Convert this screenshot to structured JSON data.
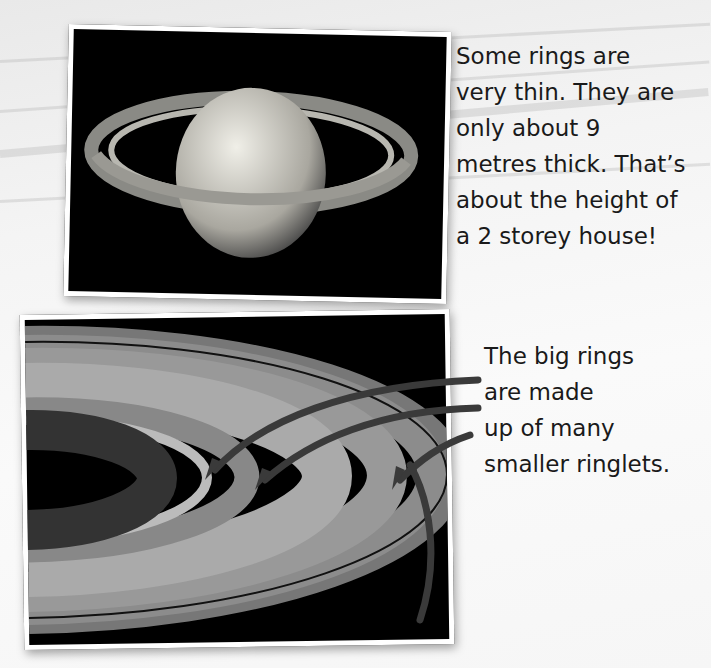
{
  "page": {
    "background": "#f4f4f4",
    "arrow_color": "#3a3a3a"
  },
  "images": [
    {
      "name": "saturn-full-view",
      "alt": "Saturn with its rings"
    },
    {
      "name": "saturn-rings-closeup",
      "alt": "Close-up of Saturn's rings and ringlets"
    }
  ],
  "captions": {
    "thin_rings": {
      "lines": [
        "Some rings are",
        "very thin. They are",
        "only about 9",
        "metres thick. That’s",
        "about the height of",
        "a 2 storey house!"
      ]
    },
    "ringlets": {
      "lines": [
        "The big rings",
        "are made",
        "up of many",
        "smaller ringlets."
      ]
    }
  }
}
